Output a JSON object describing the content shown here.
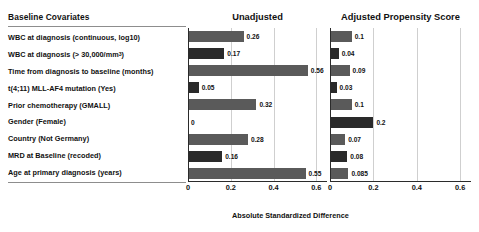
{
  "chart_data": {
    "type": "bar",
    "orientation": "horizontal",
    "title": "",
    "xlabel": "Absolute Standardized Difference",
    "ylabel": "",
    "xlim": [
      0,
      0.65
    ],
    "xticks": [
      0,
      0.2,
      0.4,
      0.6
    ],
    "xtick_labels": [
      "0",
      "0.2",
      "0.4",
      "0.6"
    ],
    "grid": true,
    "grid_axis": "x",
    "legend": false,
    "categories_header": "Baseline Covariates",
    "categories": [
      "WBC at diagnosis (continuous, log10)",
      "WBC at diagnosis (> 30,000/mm³)",
      "Time from diagnosis to baseline (months)",
      "t(4;11) MLL-AF4 mutation (Yes)",
      "Prior chemotherapy (GMALL)",
      "Gender (Female)",
      "Country (Not Germany)",
      "MRD at Baseline (recoded)",
      "Age at primary diagnosis (years)"
    ],
    "series": [
      {
        "name": "Unadjusted",
        "values": [
          0.26,
          0.17,
          0.56,
          0.05,
          0.32,
          0,
          0.28,
          0.16,
          0.55
        ],
        "value_labels": [
          "0.26",
          "0.17",
          "0.56",
          "0.05",
          "0.32",
          "0",
          "0.28",
          "0.16",
          "0.55"
        ]
      },
      {
        "name": "Adjusted Propensity Score",
        "values": [
          0.1,
          0.04,
          0.09,
          0.03,
          0.1,
          0.2,
          0.07,
          0.08,
          0.085
        ],
        "value_labels": [
          "0.1",
          "0.04",
          "0.09",
          "0.03",
          "0.1",
          "0.2",
          "0.07",
          "0.08",
          "0.085"
        ]
      }
    ],
    "colors": {
      "bar_light": "#5a5a5a",
      "bar_dark": "#2a2a2a",
      "gridline": "#cfcfcf",
      "axis": "#2b2b2b",
      "text": "#111111"
    }
  },
  "labels": {
    "header": "Baseline Covariates",
    "rows": [
      "WBC at diagnosis (continuous, log10)",
      "WBC at diagnosis (> 30,000/mm",
      "Time from diagnosis to baseline (months)",
      "t(4;11) MLL-AF4 mutation (Yes)",
      "Prior chemotherapy (GMALL)",
      "Gender (Female)",
      "Country (Not Germany)",
      "MRD at Baseline (recoded)",
      "Age at primary diagnosis (years)"
    ],
    "row1_superscript": "3",
    "row1_suffix": ")"
  },
  "panels": {
    "unadjusted_title": "Unadjusted",
    "adjusted_title": "Adjusted Propensity Score"
  },
  "axis": {
    "caption": "Absolute Standardized Difference",
    "ticks": [
      "0",
      "0.2",
      "0.4",
      "0.6"
    ]
  }
}
